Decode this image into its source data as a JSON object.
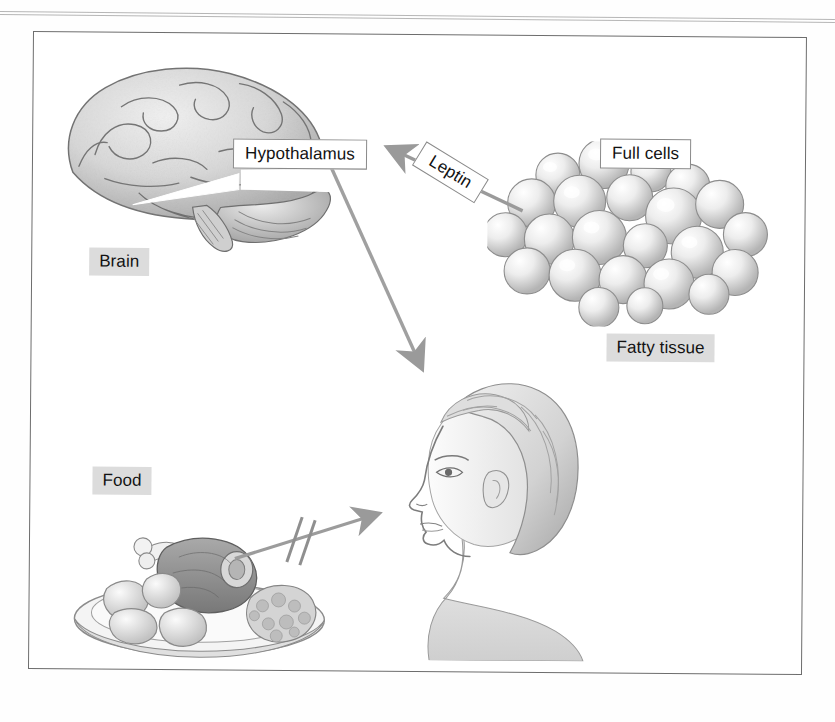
{
  "figure": {
    "border_color": "#6d6d6d",
    "background_color": "#ffffff"
  },
  "labels": {
    "hypothalamus": "Hypothalamus",
    "leptin": "Leptin",
    "full_cells": "Full cells",
    "fatty_tissue": "Fatty tissue",
    "brain": "Brain",
    "food": "Food"
  },
  "label_styles": {
    "boxed_background": "#ffffff",
    "boxed_border": "#8a8a8a",
    "gray_background": "#dcdcdc",
    "text_color": "#121212"
  },
  "illustrations": [
    {
      "name": "brain-illustration",
      "caption": "Brain"
    },
    {
      "name": "fat-cells-illustration",
      "caption": "Full cells"
    },
    {
      "name": "food-illustration",
      "caption": "Food"
    },
    {
      "name": "woman-illustration",
      "caption": "Woman in profile"
    }
  ],
  "arrows": [
    {
      "name": "leptin-arrow",
      "from": "Full cells",
      "to": "Hypothalamus",
      "label": "Leptin",
      "blocked": false,
      "color": "#9a9a9a"
    },
    {
      "name": "hypothalamus-to-woman-arrow",
      "from": "Hypothalamus",
      "to": "Woman",
      "label": "",
      "blocked": false,
      "color": "#a0a0a0"
    },
    {
      "name": "food-to-woman-arrow",
      "from": "Food",
      "to": "Woman",
      "label": "",
      "blocked": true,
      "color": "#9c9c9c"
    }
  ],
  "colors": {
    "arrow_gray": "#9a9a9a",
    "pencil_light": "#e4e4e4",
    "pencil_mid": "#bdbdbd",
    "pencil_dark": "#8e8e8e",
    "rule_gray": "#a9a9a9"
  }
}
